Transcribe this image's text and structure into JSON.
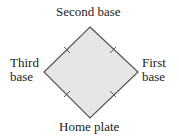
{
  "diagram": {
    "labels": {
      "second_base": "Second base",
      "home_plate": "Home plate",
      "third_base": [
        "Third",
        "base"
      ],
      "first_base": [
        "First",
        "base"
      ]
    },
    "shape": {
      "type": "square-rotated-45 (baseball diamond)",
      "fill": "#e6e6e6",
      "stroke": "#555555",
      "vertices": {
        "second_base": [
          90,
          27
        ],
        "first_base": [
          138,
          72
        ],
        "home_plate": [
          90,
          118
        ],
        "third_base": [
          44,
          72
        ]
      },
      "equal_side_tick_marks": 4
    }
  }
}
